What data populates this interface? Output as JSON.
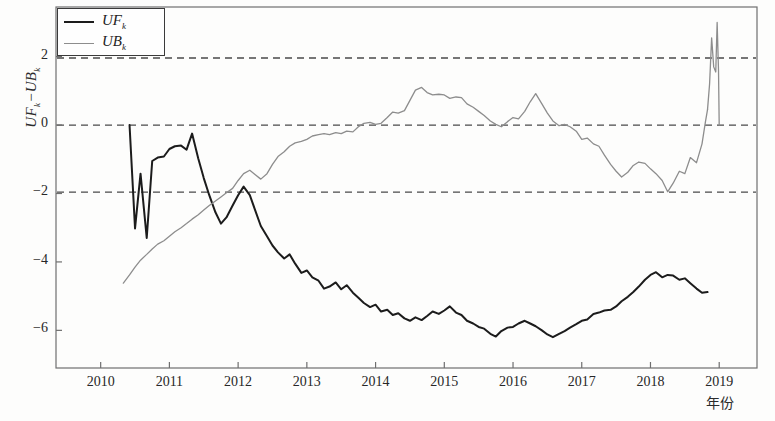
{
  "chart_data": {
    "type": "line",
    "title": "",
    "subtitle": "",
    "xlabel": "年份",
    "ylabel": "UF_k−UB_k",
    "ylabel_parts": {
      "a": "UF",
      "a_sub": "k",
      "sep": "−",
      "b": "UB",
      "b_sub": "k"
    },
    "xlim": [
      2009.35,
      2019.55
    ],
    "ylim": [
      -7.1,
      3.45
    ],
    "grid": false,
    "legend_position": "top-left",
    "x_ticks": [
      2010,
      2011,
      2012,
      2013,
      2014,
      2015,
      2016,
      2017,
      2018,
      2019
    ],
    "x_tick_labels": [
      "2010",
      "2011",
      "2012",
      "2013",
      "2014",
      "2015",
      "2016",
      "2017",
      "2018",
      "2019"
    ],
    "y_ticks": [
      2,
      0,
      -2,
      -4,
      -6
    ],
    "y_tick_labels": [
      "2",
      "0",
      "−2",
      "−4",
      "−6"
    ],
    "reference_lines": [
      {
        "name": "upper-confidence-limit",
        "y": 1.96,
        "style": "dashed",
        "color": "#4a4a4a"
      },
      {
        "name": "zero-line",
        "y": 0,
        "style": "dashed",
        "color": "#4a4a4a"
      },
      {
        "name": "lower-confidence-limit",
        "y": -1.96,
        "style": "dashed",
        "color": "#4a4a4a"
      }
    ],
    "legend": [
      {
        "name": "UF_k",
        "label_main": "UF",
        "label_sub": "k",
        "color": "#1c1c1c",
        "width": 2.2
      },
      {
        "name": "UB_k",
        "label_main": "UB",
        "label_sub": "k",
        "color": "#8d8d8d",
        "width": 1.3
      }
    ],
    "series": [
      {
        "name": "UF_k",
        "color": "#1c1c1c",
        "width": 2.0,
        "x": [
          2010.42,
          2010.5,
          2010.58,
          2010.67,
          2010.75,
          2010.83,
          2010.92,
          2011.0,
          2011.08,
          2011.17,
          2011.25,
          2011.33,
          2011.42,
          2011.5,
          2011.58,
          2011.67,
          2011.75,
          2011.83,
          2011.92,
          2012.0,
          2012.08,
          2012.17,
          2012.25,
          2012.33,
          2012.42,
          2012.5,
          2012.58,
          2012.67,
          2012.75,
          2012.83,
          2012.92,
          2013.0,
          2013.08,
          2013.17,
          2013.25,
          2013.33,
          2013.42,
          2013.5,
          2013.58,
          2013.67,
          2013.75,
          2013.83,
          2013.92,
          2014.0,
          2014.08,
          2014.17,
          2014.25,
          2014.33,
          2014.42,
          2014.5,
          2014.58,
          2014.67,
          2014.75,
          2014.83,
          2014.92,
          2015.0,
          2015.08,
          2015.17,
          2015.25,
          2015.33,
          2015.42,
          2015.5,
          2015.58,
          2015.67,
          2015.75,
          2015.83,
          2015.92,
          2016.0,
          2016.08,
          2016.17,
          2016.25,
          2016.33,
          2016.42,
          2016.5,
          2016.58,
          2016.67,
          2016.75,
          2016.83,
          2016.92,
          2017.0,
          2017.08,
          2017.17,
          2017.25,
          2017.33,
          2017.42,
          2017.5,
          2017.58,
          2017.67,
          2017.75,
          2017.83,
          2017.92,
          2018.0,
          2018.08,
          2018.17,
          2018.25,
          2018.33,
          2018.42,
          2018.5,
          2018.58,
          2018.67,
          2018.75,
          2018.83
        ],
        "y": [
          0.0,
          -3.02,
          -1.42,
          -3.3,
          -1.05,
          -0.95,
          -0.92,
          -0.7,
          -0.62,
          -0.6,
          -0.72,
          -0.25,
          -0.98,
          -1.55,
          -2.05,
          -2.55,
          -2.88,
          -2.7,
          -2.35,
          -2.05,
          -1.8,
          -2.05,
          -2.5,
          -2.95,
          -3.25,
          -3.52,
          -3.72,
          -3.9,
          -3.78,
          -4.05,
          -4.32,
          -4.25,
          -4.45,
          -4.55,
          -4.78,
          -4.72,
          -4.6,
          -4.8,
          -4.68,
          -4.9,
          -5.05,
          -5.2,
          -5.32,
          -5.25,
          -5.45,
          -5.4,
          -5.55,
          -5.5,
          -5.65,
          -5.72,
          -5.62,
          -5.7,
          -5.58,
          -5.45,
          -5.52,
          -5.42,
          -5.3,
          -5.48,
          -5.55,
          -5.72,
          -5.8,
          -5.9,
          -5.95,
          -6.1,
          -6.18,
          -6.02,
          -5.92,
          -5.9,
          -5.8,
          -5.72,
          -5.8,
          -5.88,
          -6.0,
          -6.12,
          -6.2,
          -6.1,
          -6.02,
          -5.92,
          -5.82,
          -5.72,
          -5.68,
          -5.52,
          -5.48,
          -5.42,
          -5.4,
          -5.3,
          -5.15,
          -5.02,
          -4.88,
          -4.72,
          -4.52,
          -4.38,
          -4.3,
          -4.45,
          -4.38,
          -4.4,
          -4.52,
          -4.48,
          -4.62,
          -4.78,
          -4.9,
          -4.88
        ]
      },
      {
        "name": "UB_k",
        "color": "#8d8d8d",
        "width": 1.3,
        "x": [
          2010.33,
          2010.42,
          2010.5,
          2010.58,
          2010.67,
          2010.75,
          2010.83,
          2010.92,
          2011.0,
          2011.08,
          2011.17,
          2011.25,
          2011.33,
          2011.42,
          2011.5,
          2011.58,
          2011.67,
          2011.75,
          2011.83,
          2011.92,
          2012.0,
          2012.08,
          2012.17,
          2012.25,
          2012.33,
          2012.42,
          2012.5,
          2012.58,
          2012.67,
          2012.75,
          2012.83,
          2012.92,
          2013.0,
          2013.08,
          2013.17,
          2013.25,
          2013.33,
          2013.42,
          2013.5,
          2013.58,
          2013.67,
          2013.75,
          2013.83,
          2013.92,
          2014.0,
          2014.08,
          2014.17,
          2014.25,
          2014.33,
          2014.42,
          2014.5,
          2014.58,
          2014.67,
          2014.75,
          2014.83,
          2014.92,
          2015.0,
          2015.08,
          2015.17,
          2015.25,
          2015.33,
          2015.42,
          2015.5,
          2015.58,
          2015.67,
          2015.75,
          2015.83,
          2015.92,
          2016.0,
          2016.08,
          2016.17,
          2016.25,
          2016.33,
          2016.42,
          2016.5,
          2016.58,
          2016.67,
          2016.75,
          2016.83,
          2016.92,
          2017.0,
          2017.08,
          2017.17,
          2017.25,
          2017.33,
          2017.42,
          2017.5,
          2017.58,
          2017.67,
          2017.75,
          2017.83,
          2017.92,
          2018.0,
          2018.08,
          2018.17,
          2018.25,
          2018.33,
          2018.42,
          2018.5,
          2018.58,
          2018.67,
          2018.75,
          2018.8,
          2018.83
        ],
        "y": [
          -4.62,
          -4.38,
          -4.15,
          -3.95,
          -3.78,
          -3.62,
          -3.48,
          -3.38,
          -3.25,
          -3.12,
          -3.0,
          -2.88,
          -2.75,
          -2.62,
          -2.48,
          -2.35,
          -2.22,
          -2.1,
          -1.98,
          -1.85,
          -1.62,
          -1.42,
          -1.32,
          -1.45,
          -1.58,
          -1.42,
          -1.15,
          -0.92,
          -0.78,
          -0.62,
          -0.52,
          -0.48,
          -0.42,
          -0.32,
          -0.28,
          -0.25,
          -0.28,
          -0.22,
          -0.25,
          -0.18,
          -0.2,
          -0.05,
          0.05,
          0.08,
          0.02,
          0.05,
          0.22,
          0.38,
          0.35,
          0.42,
          0.72,
          1.02,
          1.1,
          0.95,
          0.88,
          0.9,
          0.88,
          0.78,
          0.82,
          0.8,
          0.62,
          0.52,
          0.4,
          0.28,
          0.12,
          0.02,
          -0.05,
          0.1,
          0.22,
          0.18,
          0.4,
          0.68,
          0.92,
          0.62,
          0.35,
          0.12,
          -0.02,
          0.02,
          -0.05,
          -0.18,
          -0.42,
          -0.38,
          -0.55,
          -0.62,
          -0.88,
          -1.15,
          -1.35,
          -1.52,
          -1.38,
          -1.18,
          -1.08,
          -1.12,
          -1.28,
          -1.42,
          -1.62,
          -1.95,
          -1.7,
          -1.35,
          -1.42,
          -0.95,
          -1.1,
          -0.55,
          0.1,
          0.45
        ]
      }
    ],
    "ub_spike_segment": {
      "name": "UB_k-terminal-spike",
      "x": [
        2018.83,
        2018.86,
        2018.89,
        2018.92,
        2018.95,
        2018.97,
        2018.99,
        2019.0,
        2019.0
      ],
      "y": [
        0.45,
        1.2,
        2.55,
        1.7,
        1.55,
        3.0,
        1.6,
        0.0,
        0.0
      ]
    }
  }
}
